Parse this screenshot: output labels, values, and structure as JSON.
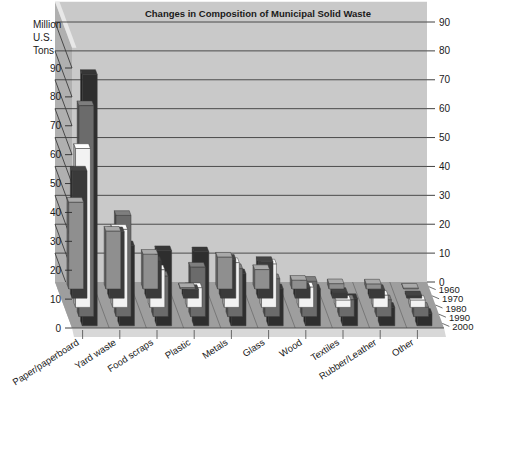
{
  "chart_data": {
    "type": "bar",
    "title": "Changes in Composition of Municipal Solid Waste",
    "ylabel": "Million U.S. Tons",
    "xlabel": "",
    "zlabel": "",
    "ylim": [
      0,
      90
    ],
    "y_ticks": [
      0,
      10,
      20,
      30,
      40,
      50,
      60,
      70,
      80,
      90
    ],
    "y_ticks_right": [
      0,
      10,
      20,
      30,
      40,
      50,
      60,
      70,
      80,
      90
    ],
    "grid": true,
    "legend_position": "depth-axis-right",
    "projection": "3d",
    "categories": [
      "Paper/paperboard",
      "Yard waste",
      "Food scraps",
      "Plastic",
      "Metals",
      "Glass",
      "Wood",
      "Textiles",
      "Rubber/Leather",
      "Other"
    ],
    "depth_categories": [
      "1960",
      "1970",
      "1980",
      "1990",
      "2000"
    ],
    "series": [
      {
        "name": "1960",
        "color": "#8f8f8f",
        "values": [
          30,
          20,
          12,
          0.4,
          11,
          6.7,
          3.0,
          1.8,
          1.7,
          0.1
        ]
      },
      {
        "name": "1970",
        "color": "#3a3a3a",
        "values": [
          44,
          23,
          12.8,
          3.0,
          13.5,
          12.7,
          3.7,
          2.0,
          3.0,
          0.8
        ]
      },
      {
        "name": "1980",
        "color": "#f2f2f2",
        "values": [
          55,
          27,
          13,
          6.8,
          15.5,
          15.0,
          7.0,
          2.5,
          4.2,
          2.5
        ]
      },
      {
        "name": "1990",
        "color": "#6b6b6b",
        "values": [
          73,
          35,
          14,
          17.1,
          16.6,
          13.1,
          12.2,
          5.8,
          5.8,
          3.2
        ]
      },
      {
        "name": "2000",
        "color": "#2e2e2e",
        "values": [
          87,
          27.7,
          26,
          25.6,
          18.0,
          12.8,
          12.7,
          9.4,
          6.4,
          4.3
        ]
      }
    ]
  },
  "canvas": {
    "background": "#ffffff",
    "wall_color": "#c9c9c9",
    "wall_side_color": "#b0b0b0",
    "floor_color": "#9e9e9e",
    "floor_front_color": "#d8d8d8"
  }
}
